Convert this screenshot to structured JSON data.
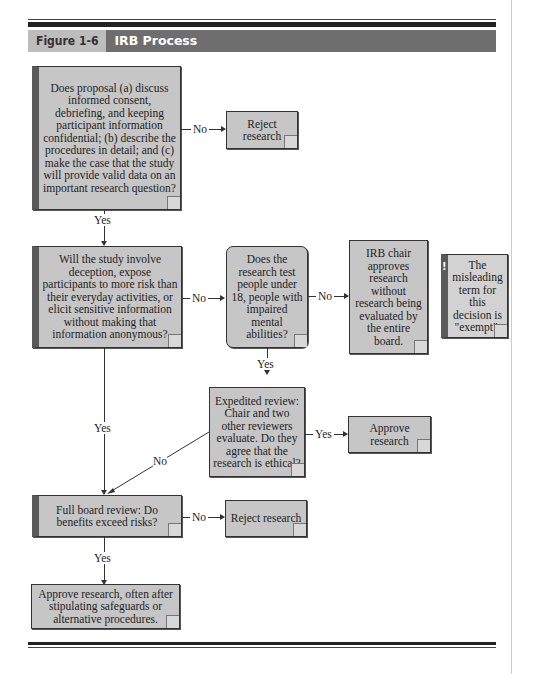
{
  "header": {
    "figure_label": "Figure 1-6",
    "title": "IRB Process"
  },
  "nodes": {
    "q1": "Does proposal (a) discuss informed consent, debriefing, and keeping participant information confidential; (b) describe the procedures in detail; and (c) make the case that the study will provide valid data on an important research question?",
    "reject1": "Reject research",
    "q2": "Will the study involve deception, expose participants to more risk than their everyday activities, or elicit sensitive information without making that information anonymous?",
    "q3": "Does the research test people under 18, people with impaired mental abilities?",
    "exempt": "IRB chair approves research without research being evaluated by the entire board.",
    "note": "The misleading term for this decision is \"exempt\".",
    "expedited": "Expedited review: Chair and two other reviewers evaluate. Do they agree that the research is ethical?",
    "approve1": "Approve research",
    "full": "Full board review: Do benefits exceed risks?",
    "reject2": "Reject research",
    "approve2": "Approve research, often after stipulating safeguards or alternative procedures."
  },
  "edges": {
    "q1_no": "No",
    "q1_yes": "Yes",
    "q2_no": "No",
    "q2_yes": "Yes",
    "q3_no": "No",
    "q3_yes": "Yes",
    "exp_yes": "Yes",
    "exp_no": "No",
    "full_no": "No",
    "full_yes": "Yes"
  },
  "icons": {
    "note_marker": "!"
  }
}
